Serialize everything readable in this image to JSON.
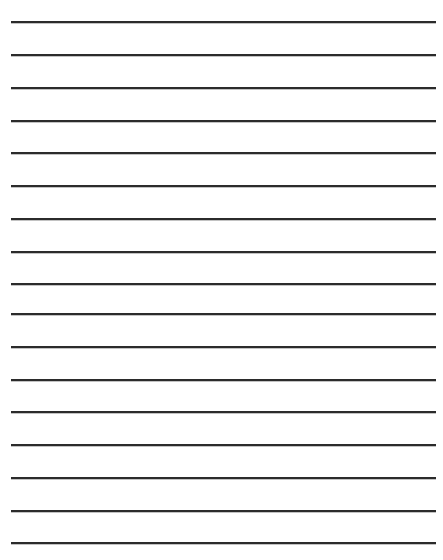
{
  "document": {
    "kind": "lined-writing-paper",
    "title": "Blank Lined Paper",
    "page_label": "",
    "orientation": "portrait",
    "width_px": 443,
    "height_px": 560,
    "background_color": "#ffffff",
    "has_text_content": false,
    "has_margin_rule": false,
    "has_header": false,
    "writing_area_text": ""
  },
  "rules": {
    "count": 17,
    "color": "#2b2b2b",
    "antialias_color": "#787878",
    "thickness_px": 2,
    "left_px": 11,
    "right_px": 436,
    "length_px": 425,
    "first_y_px": 21,
    "spacing_px": 32.6,
    "items": [
      {
        "index": 1,
        "y_px": 21
      },
      {
        "index": 2,
        "y_px": 54
      },
      {
        "index": 3,
        "y_px": 87
      },
      {
        "index": 4,
        "y_px": 120
      },
      {
        "index": 5,
        "y_px": 152
      },
      {
        "index": 6,
        "y_px": 185
      },
      {
        "index": 7,
        "y_px": 218
      },
      {
        "index": 8,
        "y_px": 251
      },
      {
        "index": 9,
        "y_px": 283
      },
      {
        "index": 10,
        "y_px": 313
      },
      {
        "index": 11,
        "y_px": 346
      },
      {
        "index": 12,
        "y_px": 379
      },
      {
        "index": 13,
        "y_px": 411
      },
      {
        "index": 14,
        "y_px": 444
      },
      {
        "index": 15,
        "y_px": 477
      },
      {
        "index": 16,
        "y_px": 510
      },
      {
        "index": 17,
        "y_px": 542
      }
    ]
  }
}
